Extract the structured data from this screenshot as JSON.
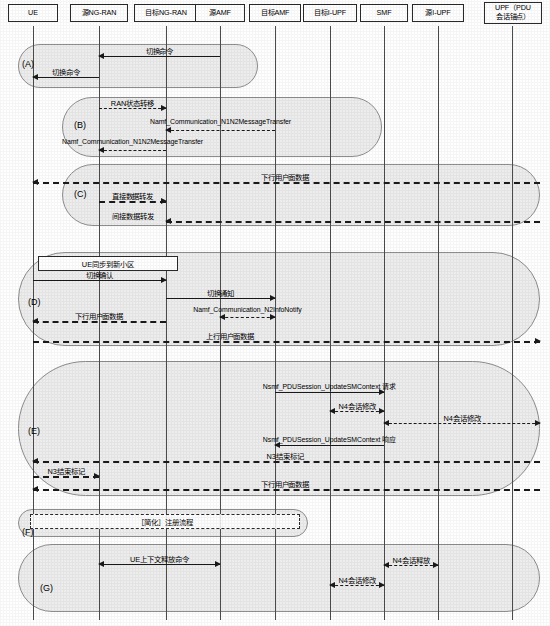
{
  "diagram": {
    "participants": [
      {
        "id": "ue",
        "label": "UE",
        "x": 33,
        "box_x": 8,
        "box_w": 50,
        "box_h": 18
      },
      {
        "id": "src_ngran",
        "label": "源NG-RAN",
        "x": 99,
        "box_x": 70,
        "box_w": 58,
        "box_h": 18
      },
      {
        "id": "tgt_ngran",
        "label": "目标NG-RAN",
        "x": 166,
        "box_x": 134,
        "box_w": 64,
        "box_h": 18
      },
      {
        "id": "src_amf",
        "label": "源AMF",
        "x": 220,
        "box_x": 195,
        "box_w": 50,
        "box_h": 18
      },
      {
        "id": "tgt_amf",
        "label": "目标AMF",
        "x": 275,
        "box_x": 249,
        "box_w": 52,
        "box_h": 18
      },
      {
        "id": "tgt_iupf",
        "label": "目标I-UPF",
        "x": 330,
        "box_x": 303,
        "box_w": 54,
        "box_h": 18
      },
      {
        "id": "smf",
        "label": "SMF",
        "x": 384,
        "box_x": 360,
        "box_w": 48,
        "box_h": 18
      },
      {
        "id": "src_iupf",
        "label": "源I-UPF",
        "x": 438,
        "box_x": 412,
        "box_w": 52,
        "box_h": 18
      },
      {
        "id": "upf",
        "label": "UPF（PDU\n会话锚点）",
        "x": 512,
        "box_x": 484,
        "box_w": 58,
        "box_h": 22
      }
    ],
    "phases": [
      {
        "id": "A",
        "label": "(A)",
        "x": 18,
        "y": 44,
        "w": 240,
        "h": 44,
        "label_x": 22,
        "label_y": 59
      },
      {
        "id": "B",
        "label": "(B)",
        "x": 62,
        "y": 97,
        "w": 320,
        "h": 60,
        "label_x": 74,
        "label_y": 120
      },
      {
        "id": "C",
        "label": "(C)",
        "x": 62,
        "y": 164,
        "w": 478,
        "h": 62,
        "label_x": 74,
        "label_y": 189
      },
      {
        "id": "D",
        "label": "(D)",
        "x": 18,
        "y": 252,
        "w": 522,
        "h": 94,
        "label_x": 28,
        "label_y": 297
      },
      {
        "id": "E",
        "label": "(E)",
        "x": 18,
        "y": 361,
        "w": 522,
        "h": 135,
        "label_x": 28,
        "label_y": 426
      },
      {
        "id": "F",
        "label": "(F)",
        "x": 18,
        "y": 509,
        "w": 290,
        "h": 28,
        "label_x": 22,
        "label_y": 527
      },
      {
        "id": "G",
        "label": "(G)",
        "x": 18,
        "y": 544,
        "w": 522,
        "h": 68,
        "label_x": 40,
        "label_y": 583
      }
    ],
    "notes": [
      {
        "id": "ue-sync-note",
        "text": "UE同步到新小区",
        "x": 38,
        "y": 256,
        "w": 140,
        "h": 15
      },
      {
        "id": "registration-note",
        "text": "［简化］注册流程",
        "x": 30,
        "y": 514,
        "w": 270,
        "h": 15,
        "dashed": true
      }
    ],
    "messages": [
      {
        "id": "m1",
        "label": "切换命令",
        "cjk": true,
        "from": 220,
        "to": 99,
        "y": 56,
        "dir": "left",
        "style": "solid",
        "label_pos": "center",
        "label_y": 45
      },
      {
        "id": "m2",
        "label": "切换命令",
        "cjk": true,
        "from": 99,
        "to": 33,
        "y": 77,
        "dir": "left",
        "style": "solid",
        "label_pos": "center",
        "label_y": 66
      },
      {
        "id": "m3",
        "label": "RAN状态转移",
        "cjk": true,
        "from": 99,
        "to": 166,
        "y": 108,
        "dir": "right",
        "style": "dashed",
        "label_pos": "center",
        "label_y": 97
      },
      {
        "id": "m4",
        "label": "Namf_Communication_N1N2MessageTransfer",
        "from": 275,
        "to": 166,
        "y": 130,
        "dir": "left",
        "style": "dashed",
        "label_pos": "right",
        "label_y": 118
      },
      {
        "id": "m5",
        "label": "Namf_Communication_N1N2MessageTransfer",
        "from": 166,
        "to": 99,
        "y": 150,
        "dir": "left",
        "style": "dashed",
        "label_pos": "right",
        "label_y": 138
      },
      {
        "id": "m6",
        "label": "下行用户面数据",
        "cjk": true,
        "from": 540,
        "to": 33,
        "y": 182,
        "dir": "left",
        "style": "thick",
        "label_pos": "center",
        "label_x": 285,
        "label_y": 171
      },
      {
        "id": "m7",
        "label": "直接数据转发",
        "cjk": true,
        "from": 99,
        "to": 166,
        "y": 201,
        "dir": "right",
        "style": "thick",
        "label_pos": "center",
        "label_y": 190
      },
      {
        "id": "m8",
        "label": "间接数据转发",
        "cjk": true,
        "from": 540,
        "to": 166,
        "y": 221,
        "dir": "left",
        "style": "thick",
        "label_pos": "center",
        "label_x": 133,
        "label_y": 210
      },
      {
        "id": "m9",
        "label": "切换确认",
        "cjk": true,
        "from": 33,
        "to": 166,
        "y": 280,
        "dir": "right",
        "style": "solid",
        "label_pos": "center",
        "label_y": 269
      },
      {
        "id": "m10",
        "label": "切换通知",
        "cjk": true,
        "from": 166,
        "to": 275,
        "y": 298,
        "dir": "right",
        "style": "solid",
        "label_pos": "center",
        "label_y": 287
      },
      {
        "id": "m11",
        "label": "Namf_Communication_N2InfoNotify",
        "from": 220,
        "to": 275,
        "y": 317,
        "dir": "both",
        "style": "dashed",
        "label_pos": "center",
        "label_y": 306
      },
      {
        "id": "m12",
        "label": "下行用户面数据",
        "cjk": true,
        "from": 166,
        "to": 33,
        "y": 321,
        "dir": "left",
        "style": "thick",
        "label_pos": "center",
        "label_x": 99,
        "label_y": 310
      },
      {
        "id": "m13",
        "label": "上行用户面数据",
        "cjk": true,
        "from": 33,
        "to": 540,
        "y": 341,
        "dir": "right",
        "style": "thick",
        "label_pos": "center",
        "label_x": 230,
        "label_y": 330
      },
      {
        "id": "m14",
        "label": "Nsmf_PDUSession_UpdateSMContext 请求",
        "from": 275,
        "to": 384,
        "y": 392,
        "dir": "right",
        "style": "solid",
        "label_pos": "center",
        "label_y": 381
      },
      {
        "id": "m15",
        "label": "N4会话修改",
        "cjk": true,
        "from": 330,
        "to": 384,
        "y": 411,
        "dir": "both",
        "style": "dashed",
        "label_pos": "center",
        "label_y": 400
      },
      {
        "id": "m16",
        "label": "N4会话修改",
        "cjk": true,
        "from": 384,
        "to": 540,
        "y": 423,
        "dir": "both",
        "style": "dashed",
        "label_pos": "center",
        "label_x": 462,
        "label_y": 412
      },
      {
        "id": "m17",
        "label": "Nsmf_PDUSession_UpdateSMContext 响应",
        "from": 384,
        "to": 275,
        "y": 445,
        "dir": "left",
        "style": "solid",
        "label_pos": "center",
        "label_y": 434
      },
      {
        "id": "m18",
        "label": "N3结束标记",
        "cjk": true,
        "from": 540,
        "to": 33,
        "y": 461,
        "dir": "left",
        "style": "thick",
        "label_pos": "center",
        "label_x": 285,
        "label_y": 450
      },
      {
        "id": "m19",
        "label": "N3结束标记",
        "cjk": true,
        "from": 33,
        "to": 99,
        "y": 476,
        "dir": "right",
        "style": "thick",
        "label_pos": "center",
        "label_y": 465
      },
      {
        "id": "m20",
        "label": "下行用户面数据",
        "cjk": true,
        "from": 540,
        "to": 33,
        "y": 489,
        "dir": "left",
        "style": "thick",
        "label_pos": "center",
        "label_x": 285,
        "label_y": 478
      },
      {
        "id": "m21",
        "label": "UE上下文释放命令",
        "cjk": true,
        "from": 99,
        "to": 220,
        "y": 564,
        "dir": "both",
        "style": "solid",
        "label_pos": "center",
        "label_y": 553
      },
      {
        "id": "m22",
        "label": "N4会话释放",
        "cjk": true,
        "from": 384,
        "to": 438,
        "y": 565,
        "dir": "both",
        "style": "dashed",
        "label_pos": "center",
        "label_y": 554
      },
      {
        "id": "m23",
        "label": "N4会话修改",
        "cjk": true,
        "from": 330,
        "to": 384,
        "y": 585,
        "dir": "both",
        "style": "dashed",
        "label_pos": "center",
        "label_y": 574
      }
    ]
  }
}
